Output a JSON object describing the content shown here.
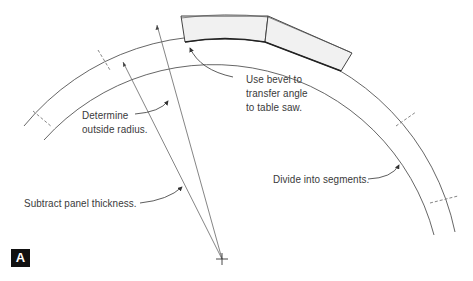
{
  "figure": {
    "badge": "A",
    "labels": {
      "bevel": [
        "Use bevel to",
        "transfer angle",
        "to table saw."
      ],
      "outside_radius": [
        "Determine",
        "outside radius."
      ],
      "subtract": "Subtract panel thickness.",
      "divide": "Divide into segments."
    },
    "colors": {
      "line": "#555555",
      "segment_fill": "#f0f0f0",
      "badge_bg": "#111111"
    }
  }
}
